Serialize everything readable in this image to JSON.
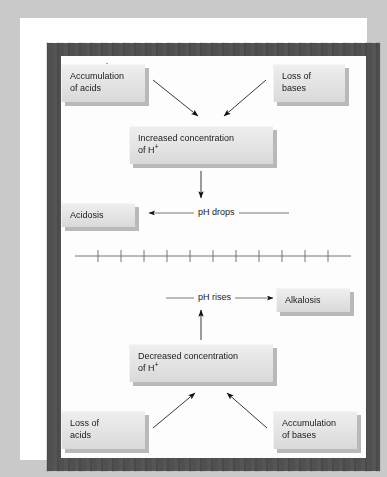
{
  "figure": {
    "background_color": "#c9c9c9",
    "canvas_color": "#fdfdfd",
    "border_color": "#555555",
    "box_fill_color": "#e3e3e3",
    "box_shadow_color": "#b9b9b9",
    "text_color": "#1a1a1a"
  },
  "boxes": {
    "accumulation_of_acids": {
      "line1": "Accumulation",
      "line2": "of acids"
    },
    "loss_of_bases": {
      "line1": "Loss of",
      "line2": "bases"
    },
    "increased_concentration": {
      "line1": "Increased concentration",
      "line2_prefix": "of H",
      "line2_sup": "+"
    },
    "acidosis": {
      "line1": "Acidosis"
    },
    "alkalosis": {
      "line1": "Alkalosis"
    },
    "decreased_concentration": {
      "line1": "Decreased concentration",
      "line2_prefix": "of H",
      "line2_sup": "+"
    },
    "loss_of_acids": {
      "line1": "Loss of",
      "line2": "acids"
    },
    "accumulation_of_bases": {
      "line1": "Accumulation",
      "line2": "of bases"
    }
  },
  "connectors": {
    "ph_drops": "pH drops",
    "ph_rises": "pH rises"
  },
  "scale": {
    "label": "pH scale",
    "marked_value": "7.4",
    "tick_count": 11,
    "marked_tick_index": 5,
    "axis_start_x": 14,
    "axis_end_x": 290,
    "axis_y": 200
  }
}
